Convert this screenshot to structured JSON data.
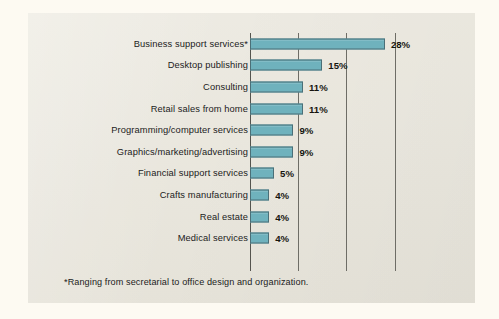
{
  "colors": {
    "page_background": "#fdfaf2",
    "panel_background": "#eae7dd",
    "bar_fill": "#6fb2bd",
    "bar_stroke": "#4b6f77",
    "gridline": "#6e6d66",
    "text": "#1b1b1b"
  },
  "footnote": "*Ranging from secretarial to office design and organization.",
  "chart_data": {
    "type": "bar",
    "orientation": "horizontal",
    "title": "",
    "subtitle": "",
    "xlabel": "",
    "ylabel": "",
    "xlim": [
      0,
      30
    ],
    "gridlines": [
      0,
      10,
      20,
      30
    ],
    "grid": true,
    "legend": false,
    "value_suffix": "%",
    "categories": [
      "Business support services*",
      "Desktop publishing",
      "Consulting",
      "Retail sales from home",
      "Programming/computer services",
      "Graphics/marketing/advertising",
      "Financial support services",
      "Crafts manufacturing",
      "Real estate",
      "Medical services"
    ],
    "values": [
      28,
      15,
      11,
      11,
      9,
      9,
      5,
      4,
      4,
      4
    ],
    "value_labels": [
      "28%",
      "15%",
      "11%",
      "11%",
      "9%",
      "9%",
      "5%",
      "4%",
      "4%",
      "4%"
    ],
    "annotations": [
      "*Ranging from secretarial to office design and organization."
    ]
  }
}
